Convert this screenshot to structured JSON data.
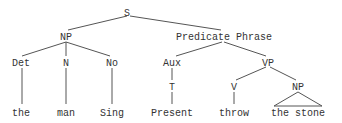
{
  "diagram": {
    "type": "syntax-tree",
    "nodes": {
      "s": "S",
      "np": "NP",
      "predicate_phrase": "Predicate Phrase",
      "det": "Det",
      "n": "N",
      "no": "No",
      "aux": "Aux",
      "vp": "VP",
      "t": "T",
      "v": "V",
      "np2": "NP",
      "the": "the",
      "man": "man",
      "sing": "Sing",
      "present": "Present",
      "throw": "throw",
      "the_stone": "the stone"
    },
    "colors": {
      "text": "#333333",
      "lines": "#555555",
      "background": "#ffffff"
    }
  }
}
